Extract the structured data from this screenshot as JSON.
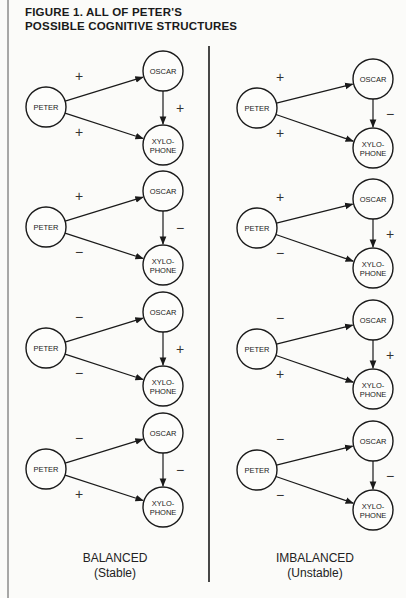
{
  "figure": {
    "title_line1": "FIGURE 1. ALL OF PETER'S",
    "title_line2": "POSSIBLE COGNITIVE STRUCTURES"
  },
  "node_labels": {
    "peter": "PETER",
    "oscar": "OSCAR",
    "xylo_line1": "XYLO-",
    "xylo_line2": "PHONE"
  },
  "columns": [
    {
      "caption": "BALANCED",
      "subcaption": "(Stable)",
      "structures": [
        {
          "peter_oscar": "+",
          "peter_xylophone": "+",
          "oscar_xylophone": "+"
        },
        {
          "peter_oscar": "+",
          "peter_xylophone": "−",
          "oscar_xylophone": "−"
        },
        {
          "peter_oscar": "−",
          "peter_xylophone": "−",
          "oscar_xylophone": "+"
        },
        {
          "peter_oscar": "−",
          "peter_xylophone": "+",
          "oscar_xylophone": "−"
        }
      ]
    },
    {
      "caption": "IMBALANCED",
      "subcaption": "(Unstable)",
      "structures": [
        {
          "peter_oscar": "+",
          "peter_xylophone": "+",
          "oscar_xylophone": "−"
        },
        {
          "peter_oscar": "+",
          "peter_xylophone": "−",
          "oscar_xylophone": "+"
        },
        {
          "peter_oscar": "−",
          "peter_xylophone": "+",
          "oscar_xylophone": "+"
        },
        {
          "peter_oscar": "−",
          "peter_xylophone": "−",
          "oscar_xylophone": "−"
        }
      ]
    }
  ]
}
